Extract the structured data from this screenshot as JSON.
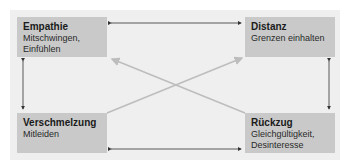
{
  "diagram": {
    "nodes": [
      {
        "id": "empathie",
        "title": "Empathie",
        "lines": [
          "Mitschwingen,",
          "Einfühlen"
        ]
      },
      {
        "id": "distanz",
        "title": "Distanz",
        "lines": [
          "Grenzen einhalten"
        ]
      },
      {
        "id": "verschmelzung",
        "title": "Verschmelzung",
        "lines": [
          "Mitleiden"
        ]
      },
      {
        "id": "rueckzug",
        "title": "Rückzug",
        "lines": [
          "Gleichgültigkeit,",
          "Desinteresse"
        ]
      }
    ],
    "edges": [
      {
        "from": "empathie",
        "to": "distanz",
        "style": "dark",
        "bidirectional": true
      },
      {
        "from": "verschmelzung",
        "to": "rueckzug",
        "style": "dark",
        "bidirectional": true
      },
      {
        "from": "empathie",
        "to": "verschmelzung",
        "style": "dark",
        "bidirectional": true
      },
      {
        "from": "distanz",
        "to": "rueckzug",
        "style": "dark",
        "bidirectional": true
      },
      {
        "from": "verschmelzung",
        "to": "distanz",
        "style": "light",
        "arrow": "end"
      },
      {
        "from": "rueckzug",
        "to": "empathie",
        "style": "light",
        "arrow": "end"
      }
    ],
    "colors": {
      "panel": "#efefef",
      "box": "#c9c9c9",
      "dark_arrow": "#333333",
      "light_arrow": "#bdbdbd"
    }
  }
}
